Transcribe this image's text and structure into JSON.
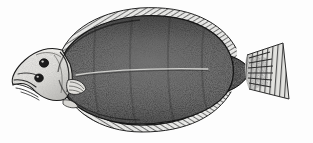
{
  "image": {
    "kind": "engraving-illustration",
    "subject": "flatfish",
    "common_name": "Flounder",
    "orientation": "left-facing, lateral view of eyed side",
    "style": "antique wood-engraving / line-and-stipple halftone",
    "width_px": 313,
    "height_px": 143,
    "caption": "",
    "background_color": "#fdfdfd",
    "ink_color": "#1d1d1d"
  },
  "palette": {
    "paper": "#fdfdfd",
    "paper_shadow": "#f2f2f0",
    "body_dark": "#2b2b2b",
    "body_mid": "#4f4f4f",
    "body_light": "#8d8d8d",
    "head_pale": "#e8e7e3",
    "head_shade": "#b9b8b4",
    "fin_hatch": "#3a3a3a",
    "fin_pale": "#cfcecb",
    "peduncle_dark": "#232323",
    "tail_pale": "#ddddda",
    "lateral_line": "#d8d8d4",
    "eye_dark": "#1a1a1a",
    "outline": "#161616"
  },
  "anatomy": {
    "parts": [
      {
        "id": "head",
        "label": "Head",
        "note": "pale, upturned, two eyes on upper (right) side"
      },
      {
        "id": "eye-upper",
        "label": "Upper eye",
        "note": "dark round spot"
      },
      {
        "id": "eye-lower",
        "label": "Lower eye",
        "note": "dark round spot, slightly forward"
      },
      {
        "id": "mouth",
        "label": "Mouth / jaw",
        "note": "small terminal mouth with fine line rays at snout"
      },
      {
        "id": "operculum",
        "label": "Gill cover",
        "note": "pale curved plate behind head"
      },
      {
        "id": "pectoral-fin",
        "label": "Pectoral fin",
        "note": "small pale fin just behind gill cover"
      },
      {
        "id": "body",
        "label": "Body",
        "note": "broad oval disc, dense stipple, darkest toward dorsal margin"
      },
      {
        "id": "lateral-line",
        "label": "Lateral line",
        "note": "faint pale line running mid-body to tail"
      },
      {
        "id": "dorsal-fin",
        "label": "Dorsal fin",
        "note": "long fin along upper margin, fine diagonal ray hatching"
      },
      {
        "id": "anal-fin",
        "label": "Anal fin",
        "note": "long fin along lower margin, fine diagonal ray hatching"
      },
      {
        "id": "caudal-peduncle",
        "label": "Caudal peduncle",
        "note": "dark narrow waist joining body to tail"
      },
      {
        "id": "caudal-fin",
        "label": "Caudal (tail) fin",
        "note": "pale fan, vertically striated rays, squared margin"
      }
    ]
  },
  "geometry": {
    "body_outline": "M 58,72 C 62,40 96,20 140,16 C 184,13 216,28 228,50 C 236,65 235,82 226,94 C 212,112 178,124 140,124 C 100,124 68,108 58,82 Z",
    "dorsal_fin_outline": "M 57,66 C 62,34 94,12 140,8 C 188,5 222,22 236,48 C 238,54 236,58 232,56 C 218,30 186,14 142,17 C 98,21 66,42 62,70 Z",
    "anal_fin_outline": "M 60,80 C 66,110 100,131 142,131 C 186,131 216,116 230,92 C 233,88 231,84 228,88 C 214,110 182,124 142,124 C 102,124 70,106 65,78 Z",
    "head_outline": "M 58,56 C 48,52 36,54 26,62 C 18,68 13,76 14,82 C 20,80 26,82 30,86 C 38,94 50,98 60,96 C 68,92 70,80 68,70 Z",
    "peduncle": "M 224,58 C 236,58 244,64 248,71 C 244,80 236,88 224,90 C 220,80 220,68 224,58 Z",
    "caudal_fin": "M 246,56 L 282,44 L 288,98 L 248,88 C 244,76 244,66 246,56 Z",
    "lateral_line": "M 76,75 C 110,70 160,68 208,69"
  },
  "rendering": {
    "stipple_density": "high",
    "hatch_angle_dorsal_deg": 58,
    "hatch_angle_anal_deg": 122,
    "tail_ray_count": 14,
    "dorsal_ray_count": 46,
    "anal_ray_count": 44
  },
  "a11y": {
    "alt": "Antique black-and-white engraving of a flounder, a flat oval fish facing left, with a pale head bearing two eyes on one side, long fringed dorsal and anal fins along the top and bottom edges, a densely stippled dark body with a faint lateral line, and a pale fan-shaped tail fin."
  }
}
